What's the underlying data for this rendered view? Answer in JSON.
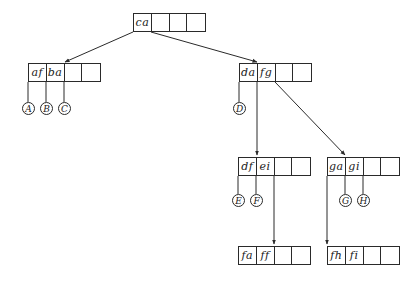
{
  "diagram": {
    "type": "b-tree",
    "colors": {
      "line": "#2a2a2a",
      "text": "#1a1a1a",
      "background": "#ffffff"
    },
    "nodes": {
      "root": {
        "cells": [
          "ca",
          "",
          "",
          ""
        ]
      },
      "n1": {
        "cells": [
          "af",
          "ba",
          "",
          ""
        ]
      },
      "n2": {
        "cells": [
          "da",
          "fg",
          "",
          ""
        ]
      },
      "n3": {
        "cells": [
          "df",
          "ei",
          "",
          ""
        ]
      },
      "n4": {
        "cells": [
          "ga",
          "gi",
          "",
          ""
        ]
      },
      "n5": {
        "cells": [
          "fa",
          "ff",
          "",
          ""
        ]
      },
      "n6": {
        "cells": [
          "fh",
          "fi",
          "",
          ""
        ]
      }
    },
    "leaves": {
      "A": "A",
      "B": "B",
      "C": "C",
      "D": "D",
      "E": "E",
      "F": "F",
      "G": "G",
      "H": "H"
    },
    "edges": [
      {
        "from": "root",
        "to": "n1"
      },
      {
        "from": "root",
        "to": "n2"
      },
      {
        "from": "n1",
        "to": "A"
      },
      {
        "from": "n1",
        "to": "B"
      },
      {
        "from": "n1",
        "to": "C"
      },
      {
        "from": "n2",
        "to": "D"
      },
      {
        "from": "n2",
        "to": "n3"
      },
      {
        "from": "n2",
        "to": "n4"
      },
      {
        "from": "n3",
        "to": "E"
      },
      {
        "from": "n3",
        "to": "F"
      },
      {
        "from": "n3",
        "to": "n5"
      },
      {
        "from": "n4",
        "to": "G"
      },
      {
        "from": "n4",
        "to": "H"
      },
      {
        "from": "n4",
        "to": "n6"
      }
    ]
  }
}
